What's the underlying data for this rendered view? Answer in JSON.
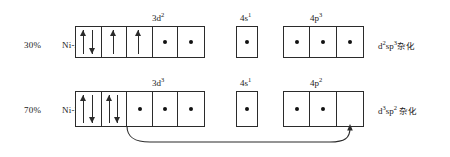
{
  "diagram": {
    "ink_color": "#2b2b2b",
    "rows": [
      {
        "id": "ni-a",
        "percent": "30%",
        "species": "Ni-A",
        "hybrid_base": "d",
        "hybrid_sup1": "2",
        "hybrid_mid": "sp",
        "hybrid_sup2": "3",
        "hybrid_cjk": "杂化",
        "groups": [
          {
            "id": "3d",
            "label_base": "3d",
            "label_sup": "2",
            "cells": [
              {
                "content": "up-down-pair"
              },
              {
                "content": "up-arrow"
              },
              {
                "content": "up-arrow"
              },
              {
                "content": "dot"
              },
              {
                "content": "dot"
              }
            ]
          },
          {
            "id": "4s",
            "label_base": "4s",
            "label_sup": "1",
            "cells": [
              {
                "content": "dot"
              }
            ]
          },
          {
            "id": "4p",
            "label_base": "4p",
            "label_sup": "3",
            "cells": [
              {
                "content": "dot"
              },
              {
                "content": "dot"
              },
              {
                "content": "dot"
              }
            ]
          }
        ]
      },
      {
        "id": "ni-b",
        "percent": "70%",
        "species": "Ni-B",
        "hybrid_base": "d",
        "hybrid_sup1": "3",
        "hybrid_mid": "sp",
        "hybrid_sup2": "2",
        "hybrid_cjk": "杂化",
        "groups": [
          {
            "id": "3d",
            "label_base": "3d",
            "label_sup": "3",
            "cells": [
              {
                "content": "up-down-pair"
              },
              {
                "content": "up-down-pair"
              },
              {
                "content": "dot"
              },
              {
                "content": "dot"
              },
              {
                "content": "dot"
              }
            ]
          },
          {
            "id": "4s",
            "label_base": "4s",
            "label_sup": "1",
            "cells": [
              {
                "content": "dot"
              }
            ]
          },
          {
            "id": "4p",
            "label_base": "4p",
            "label_sup": "2",
            "cells": [
              {
                "content": "dot"
              },
              {
                "content": "dot"
              },
              {
                "content": "empty"
              }
            ]
          }
        ]
      }
    ],
    "transfer_arrow": {
      "from": "ni-b-3d-cell-2",
      "to": "ni-b-4p-cell-3",
      "style": "curved"
    }
  }
}
